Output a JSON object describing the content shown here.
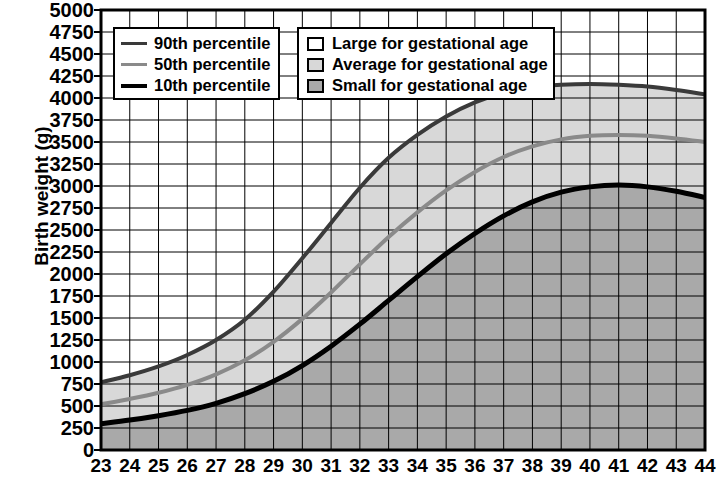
{
  "chart_data": {
    "type": "line",
    "title": "",
    "subtitle": "",
    "xlabel": "",
    "ylabel": "Birth weight (g)",
    "xlim": [
      23,
      44
    ],
    "ylim": [
      0,
      5000
    ],
    "ytick_step": 250,
    "xtick_step": 1,
    "grid": true,
    "legend_position": "top-left",
    "x": [
      23,
      24,
      25,
      26,
      27,
      28,
      29,
      30,
      31,
      32,
      33,
      34,
      35,
      36,
      37,
      38,
      39,
      40,
      41,
      42,
      43,
      44
    ],
    "xtick_labels": [
      "23",
      "24",
      "25",
      "26",
      "27",
      "28",
      "29",
      "30",
      "31",
      "32",
      "33",
      "34",
      "35",
      "36",
      "37",
      "38",
      "39",
      "40",
      "41",
      "42",
      "43",
      "44"
    ],
    "ytick_labels": [
      "0",
      "250",
      "500",
      "750",
      "1000",
      "1250",
      "1500",
      "1750",
      "2000",
      "2250",
      "2500",
      "2750",
      "3000",
      "3250",
      "3500",
      "3750",
      "4000",
      "4250",
      "4500",
      "4750",
      "5000"
    ],
    "series": [
      {
        "name": "90th percentile",
        "color": "#3a3a3a",
        "width": 4,
        "values": [
          770,
          850,
          950,
          1080,
          1250,
          1480,
          1800,
          2180,
          2580,
          2980,
          3320,
          3580,
          3790,
          3950,
          4060,
          4120,
          4150,
          4160,
          4150,
          4130,
          4090,
          4040
        ]
      },
      {
        "name": "50th percentile",
        "color": "#8a8a8a",
        "width": 4,
        "values": [
          520,
          580,
          650,
          740,
          860,
          1020,
          1230,
          1490,
          1790,
          2110,
          2420,
          2700,
          2950,
          3160,
          3330,
          3450,
          3530,
          3570,
          3580,
          3570,
          3540,
          3500
        ]
      },
      {
        "name": "10th percentile",
        "color": "#000000",
        "width": 5,
        "values": [
          300,
          340,
          390,
          450,
          530,
          640,
          780,
          960,
          1180,
          1430,
          1700,
          1970,
          2230,
          2460,
          2660,
          2820,
          2930,
          2990,
          3010,
          2990,
          2940,
          2870
        ]
      }
    ],
    "bands": [
      {
        "name": "Large for gestational age",
        "fill": "#ffffff",
        "above": "90th percentile"
      },
      {
        "name": "Average for gestational age",
        "fill": "#d8d8d8",
        "between": [
          "90th percentile",
          "10th percentile"
        ]
      },
      {
        "name": "Small for gestational age",
        "fill": "#a9a9a9",
        "below": "10th percentile"
      }
    ]
  },
  "axes": {
    "ylabel": "Birth weight (g)"
  },
  "legend_lines": {
    "items": [
      {
        "label": "90th percentile",
        "color": "#3a3a3a",
        "thickness": "3px"
      },
      {
        "label": "50th percentile",
        "color": "#8a8a8a",
        "thickness": "3px"
      },
      {
        "label": "10th percentile",
        "color": "#000000",
        "thickness": "4px"
      }
    ]
  },
  "legend_areas": {
    "items": [
      {
        "label": "Large for gestational age",
        "fill": "#ffffff"
      },
      {
        "label": "Average for gestational age",
        "fill": "#d8d8d8"
      },
      {
        "label": "Small for gestational age",
        "fill": "#a9a9a9"
      }
    ]
  }
}
